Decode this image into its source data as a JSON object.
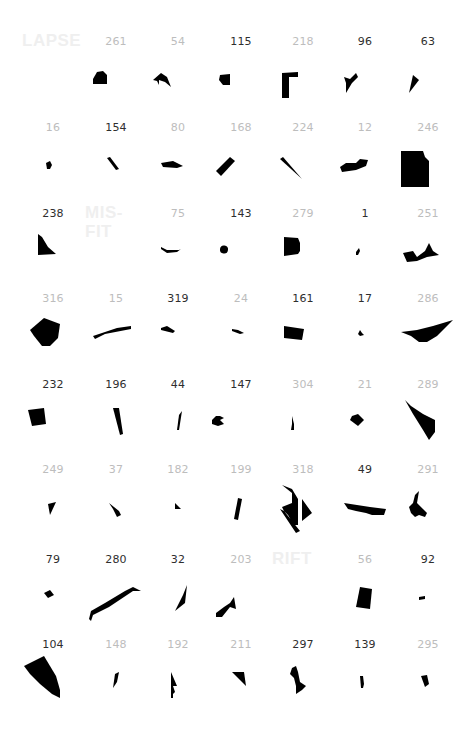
{
  "colors": {
    "background": "#ffffff",
    "label_dark": "#2e2e2e",
    "label_light": "#bdbdbd",
    "word": "#efefef",
    "shape": "#000000"
  },
  "grid": {
    "columns": 7,
    "rows": 8,
    "col_x": [
      22,
      85,
      147,
      210,
      272,
      334,
      397
    ],
    "row_y": [
      35,
      121,
      207,
      292,
      378,
      463,
      553,
      638
    ],
    "cells": [
      {
        "type": "word",
        "text": "LAPSE"
      },
      {
        "type": "item",
        "label": "261",
        "tone": "light",
        "path": "M8,44 L12,37 L18,36 L22,40 L22,49 L8,49 Z"
      },
      {
        "type": "item",
        "label": "54",
        "tone": "light",
        "path": "M6,45 L14,38 L20,42 L24,52 L18,47 L12,45 L12,50 L10,46 Z"
      },
      {
        "type": "item",
        "label": "115",
        "tone": "dark",
        "path": "M10,40 L20,39 L20,50 L13,50 L9,45 Z"
      },
      {
        "type": "item",
        "label": "218",
        "tone": "light",
        "path": "M10,38 L26,37 L26,42 L17,42 L17,63 L10,63 Z"
      },
      {
        "type": "item",
        "label": "96",
        "tone": "dark",
        "path": "M10,42 L16,44 L22,38 L24,42 L18,48 L12,58 L12,48 Z"
      },
      {
        "type": "item",
        "label": "63",
        "tone": "dark",
        "path": "M16,40 L22,45 L12,58 Z"
      },
      {
        "type": "item",
        "label": "16",
        "tone": "light",
        "path": "M24,42 L28,40 L30,44 L28,48 L25,48 Z"
      },
      {
        "type": "item",
        "label": "154",
        "tone": "dark",
        "path": "M22,37 L25,36 L34,48 L31,49 Z"
      },
      {
        "type": "item",
        "label": "80",
        "tone": "light",
        "path": "M14,42 L26,40 L36,45 L30,47 L16,46 Z"
      },
      {
        "type": "item",
        "label": "168",
        "tone": "light",
        "path": "M6,50 L20,36 L25,40 L11,55 Z"
      },
      {
        "type": "item",
        "label": "224",
        "tone": "light",
        "path": "M8,38 L11,36 L30,58 Z"
      },
      {
        "type": "item",
        "label": "12",
        "tone": "light",
        "path": "M6,46 L12,42 L22,42 L26,38 L34,39 L32,45 L22,49 L8,51 Z"
      },
      {
        "type": "item",
        "label": "246",
        "tone": "light",
        "path": "M4,30 L26,30 L28,36 L32,40 L32,66 L4,66 Z"
      },
      {
        "type": "item",
        "label": "238",
        "tone": "dark",
        "path": "M16,27 L20,30 L26,40 L34,47 L16,48 Z"
      },
      {
        "type": "word",
        "text": "MIS-\nFIT"
      },
      {
        "type": "item",
        "label": "75",
        "tone": "light",
        "path": "M14,40 L20,43 L32,43 L34,42 L30,45 L20,46 L14,42 Z"
      },
      {
        "type": "item",
        "label": "143",
        "tone": "dark",
        "path": "M10,42 A4,4 0 1,1 18,43 A4,4 0 1,1 10,42 Z"
      },
      {
        "type": "item",
        "label": "279",
        "tone": "light",
        "path": "M12,30 L26,31 L28,36 L28,44 L26,47 L12,49 Z"
      },
      {
        "type": "item",
        "label": "1",
        "tone": "dark",
        "path": "M22,45 L25,41 L26,44 L24,48 L22,48 Z"
      },
      {
        "type": "item",
        "label": "251",
        "tone": "light",
        "path": "M6,46 L16,44 L20,50 L28,44 L32,36 L36,44 L42,48 L30,50 L20,54 L10,55 Z"
      },
      {
        "type": "item",
        "label": "316",
        "tone": "light",
        "path": "M8,38 L22,26 L38,32 L36,46 L28,54 L20,54 L12,44 Z"
      },
      {
        "type": "item",
        "label": "15",
        "tone": "light",
        "path": "M8,44 L32,36 L46,34 L46,37 L20,42 L10,47 Z"
      },
      {
        "type": "item",
        "label": "319",
        "tone": "dark",
        "path": "M14,36 L20,34 L28,39 L26,41 L14,38 Z"
      },
      {
        "type": "item",
        "label": "24",
        "tone": "light",
        "path": "M22,37 L28,38 L34,41 L30,42 L22,39 Z"
      },
      {
        "type": "item",
        "label": "161",
        "tone": "dark",
        "path": "M12,34 L32,37 L30,48 L12,46 Z"
      },
      {
        "type": "item",
        "label": "17",
        "tone": "dark",
        "path": "M24,42 L26,38 L28,41 L30,43 L26,44 Z"
      },
      {
        "type": "item",
        "label": "286",
        "tone": "light",
        "path": "M4,40 L20,38 L36,34 L56,28 L40,44 L30,50 L22,50 L14,44 Z"
      },
      {
        "type": "item",
        "label": "232",
        "tone": "dark",
        "path": "M6,32 L22,30 L24,46 L10,48 Z"
      },
      {
        "type": "item",
        "label": "196",
        "tone": "dark",
        "path": "M28,30 L34,30 L38,56 L35,57 Z"
      },
      {
        "type": "item",
        "label": "44",
        "tone": "dark",
        "path": "M32,37 L35,33 L32,52 L30,52 Z"
      },
      {
        "type": "item",
        "label": "147",
        "tone": "dark",
        "path": "M2,42 L6,38 L10,38 L14,40 L10,42 L14,46 L8,48 L2,46 Z"
      },
      {
        "type": "item",
        "label": "304",
        "tone": "light",
        "path": "M20,38 L21,42 L22,46 L22,52 L19,52 L20,46 Z"
      },
      {
        "type": "item",
        "label": "21",
        "tone": "light",
        "path": "M18,38 L24,36 L30,42 L24,48 L16,42 Z"
      },
      {
        "type": "item",
        "label": "289",
        "tone": "light",
        "path": "M8,22 L14,28 L26,36 L38,42 L38,54 L32,62 L26,52 L16,36 Z"
      },
      {
        "type": "item",
        "label": "249",
        "tone": "light",
        "path": "M26,41 L34,39 L28,52 Z"
      },
      {
        "type": "item",
        "label": "37",
        "tone": "light",
        "path": "M24,40 L34,48 L36,52 L32,54 L28,46 Z"
      },
      {
        "type": "item",
        "label": "182",
        "tone": "light",
        "path": "M28,40 L34,46 L28,46 Z"
      },
      {
        "type": "item",
        "label": "199",
        "tone": "light",
        "path": "M28,35 L32,36 L28,57 L24,56 Z"
      },
      {
        "type": "item",
        "label": "318",
        "tone": "light",
        "path": "M10,22 L20,26 L26,36 L26,62 L22,62 L16,52 L12,48 L10,44 L20,40 L20,30 Z M30,36 L40,50 L30,58 Z M8,46 L12,48 L28,68 L24,70 Z"
      },
      {
        "type": "item",
        "label": "49",
        "tone": "dark",
        "path": "M10,40 L36,44 L52,46 L50,52 L38,52 L32,50 L22,48 L14,46 Z"
      },
      {
        "type": "item",
        "label": "291",
        "tone": "light",
        "path": "M18,32 L22,28 L20,40 L26,46 L30,50 L28,54 L22,52 L18,54 L14,50 L12,44 L16,40 Z"
      },
      {
        "type": "item",
        "label": "79",
        "tone": "dark",
        "path": "M22,40 L28,37 L32,42 L26,45 Z"
      },
      {
        "type": "item",
        "label": "280",
        "tone": "dark",
        "path": "M4,66 L6,58 L20,50 L40,38 L48,34 L56,38 L48,38 L24,54 L8,62 L6,68 Z"
      },
      {
        "type": "item",
        "label": "32",
        "tone": "dark",
        "path": "M28,58 L38,50 L40,32 L36,42 Z"
      },
      {
        "type": "item",
        "label": "203",
        "tone": "light",
        "path": "M6,60 L14,54 L20,50 L24,44 L26,56 L20,54 L12,64 L6,64 Z"
      },
      {
        "type": "word",
        "text": "RIFT"
      },
      {
        "type": "item",
        "label": "56",
        "tone": "light",
        "path": "M26,34 L38,36 L36,56 L22,54 Z"
      },
      {
        "type": "item",
        "label": "92",
        "tone": "dark",
        "path": "M22,44 L28,43 L28,46 L22,47 Z"
      },
      {
        "type": "item",
        "label": "104",
        "tone": "dark",
        "path": "M2,28 L22,18 L34,38 L38,52 L38,60 L30,56 L18,46 L8,36 Z"
      },
      {
        "type": "item",
        "label": "148",
        "tone": "light",
        "path": "M30,36 L34,34 L32,44 L28,50 Z"
      },
      {
        "type": "item",
        "label": "192",
        "tone": "light",
        "path": "M24,34 L30,48 L26,48 L28,54 L26,56 L26,60 L24,60 Z"
      },
      {
        "type": "item",
        "label": "211",
        "tone": "light",
        "path": "M22,34 L34,34 L36,48 L30,42 Z"
      },
      {
        "type": "item",
        "label": "297",
        "tone": "dark",
        "path": "M20,30 L24,28 L26,34 L28,44 L34,48 L30,52 L24,56 L24,48 L22,40 L18,36 Z"
      },
      {
        "type": "item",
        "label": "139",
        "tone": "dark",
        "path": "M26,38 L29,38 L30,46 L29,50 L27,50 Z"
      },
      {
        "type": "item",
        "label": "295",
        "tone": "light",
        "path": "M24,38 L30,37 L32,46 L28,49 Z"
      }
    ]
  }
}
